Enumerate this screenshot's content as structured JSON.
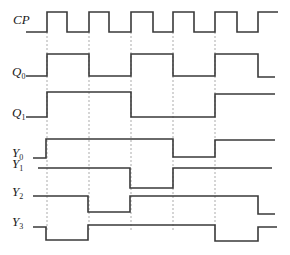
{
  "diagram": {
    "type": "timing-diagram",
    "time_edges_x": [
      47,
      89,
      131,
      173,
      215,
      258
    ],
    "signals": [
      {
        "name": "CP",
        "label_main": "CP",
        "label_sub": "",
        "label_y": 20,
        "high_y": 12,
        "low_y": 32,
        "start_x": 26,
        "end_x": 278,
        "points": "26,32 47,32 47,12 67,12 67,32 89,32 89,12 109,12 109,32 131,32 131,12 153,12 153,32 173,32 173,12 194,12 194,32 215,32 215,12 237,12 237,32 258,32 258,12 278,12"
      },
      {
        "name": "Q0",
        "label_main": "Q",
        "label_sub": "0",
        "label_y": 77,
        "high_y": 54,
        "low_y": 76,
        "start_x": 26,
        "end_x": 275,
        "points": "26,76 47,76 47,54 89,54 89,76 131,76 131,54 173,54 173,76 215,76 215,54 258,54 258,77 275,77"
      },
      {
        "name": "Q1",
        "label_main": "Q",
        "label_sub": "1",
        "label_y": 118,
        "high_y": 92,
        "low_y": 117,
        "start_x": 26,
        "end_x": 275,
        "points": "26,117 47,117 47,92 131,92 131,117 215,117 215,94 275,94"
      },
      {
        "name": "Y0",
        "label_main": "Y",
        "label_sub": "0",
        "label_y": 158,
        "points": "33,158 46,158 46,139 173,139 173,157 215,157 215,140 275,140"
      },
      {
        "name": "Y1",
        "label_main": "Y",
        "label_sub": "1",
        "label_y": 169,
        "points": "38,168 130,168 130,188 173,188 173,168 272,168"
      },
      {
        "name": "Y2",
        "label_main": "Y",
        "label_sub": "2",
        "label_y": 197,
        "points": "33,196 88,196 88,212 130,212 130,196 258,196 258,214 275,214"
      },
      {
        "name": "Y3",
        "label_main": "Y",
        "label_sub": "3",
        "label_y": 227,
        "points": "33,227 46,227 46,240 88,240 88,225 215,225 215,241 258,241 258,227 277,227"
      }
    ],
    "guide_lines": {
      "y_top": 32,
      "y_bottom": 232
    }
  }
}
